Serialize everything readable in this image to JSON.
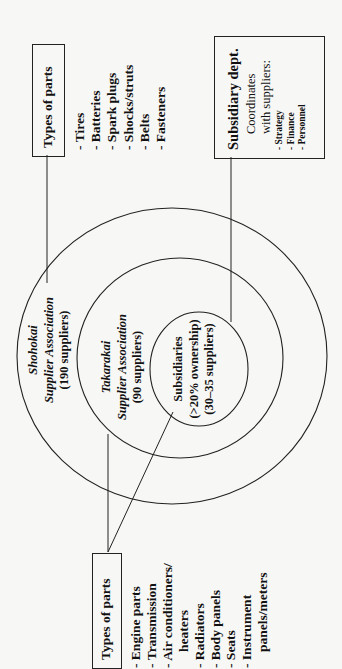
{
  "diagram": {
    "orientation": "rotated-90-ccw",
    "rings": {
      "outer": {
        "name": "Shohokai",
        "subtitle": "Supplier Association",
        "count": "(190 suppliers)"
      },
      "middle": {
        "name": "Takarakai",
        "subtitle": "Supplier Association",
        "count": "(90 suppliers)"
      },
      "inner": {
        "name": "Subsidiaries",
        "ownership": "(>20% ownership)",
        "count": "(30–35 suppliers)"
      }
    },
    "callouts": {
      "outer_parts": {
        "title": "Types of parts",
        "items": [
          "- Tires",
          "- Batteries",
          "- Spark plugs",
          "- Shocks/struts",
          "- Belts",
          "- Fasteners"
        ]
      },
      "inner_parts": {
        "title": "Types of parts",
        "items": [
          "- Engine parts",
          "- Transmission",
          "- Air conditioners/",
          "heaters",
          "- Radiators",
          "- Body panels",
          "- Seats",
          "- Instrument",
          "panels/meters"
        ]
      },
      "subsidiary_dept": {
        "title": "Subsidiary dept.",
        "line1": "Coordinates",
        "line2": "with suppliers:",
        "items": [
          "- Strategy",
          "- Finance",
          "- Personnel"
        ]
      }
    },
    "colors": {
      "stroke": "#222222",
      "background": "#f7f7f5"
    }
  }
}
